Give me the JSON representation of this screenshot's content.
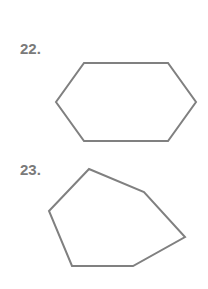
{
  "problems": [
    {
      "number_label": "22.",
      "shape": "hexagon",
      "stroke_color": "#808080",
      "points": "84,63 168,63 196,102 168,141 84,141 56,102"
    },
    {
      "number_label": "23.",
      "shape": "hexagon",
      "stroke_color": "#808080",
      "points": "89,169 144,192 185,237 133,266 72,266 49,211"
    }
  ]
}
